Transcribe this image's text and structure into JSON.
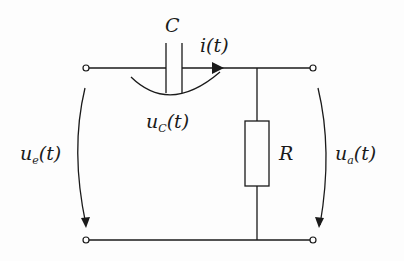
{
  "diagram": {
    "type": "circuit",
    "colors": {
      "wire": "#1a1a1a",
      "background": "#fdfdfd"
    },
    "components": [
      {
        "id": "C",
        "kind": "capacitor",
        "label": "C"
      },
      {
        "id": "R",
        "kind": "resistor",
        "label": "R"
      }
    ],
    "labels": {
      "capacitor": "C",
      "resistor": "R",
      "current": {
        "base": "i",
        "arg": "(t)"
      },
      "u_c": {
        "base": "u",
        "sub": "C",
        "arg": "(t)"
      },
      "u_e": {
        "base": "u",
        "sub": "e",
        "arg": "(t)"
      },
      "u_a": {
        "base": "u",
        "sub": "a",
        "arg": "(t)"
      }
    },
    "terminals": [
      {
        "id": "in-top",
        "role": "input"
      },
      {
        "id": "in-bottom",
        "role": "input"
      },
      {
        "id": "out-top",
        "role": "output"
      },
      {
        "id": "out-bottom",
        "role": "output"
      }
    ]
  }
}
